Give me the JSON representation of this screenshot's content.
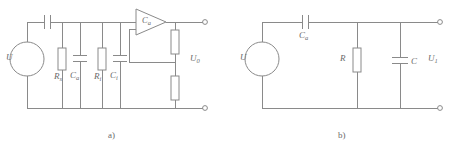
{
  "figure": {
    "background_color": "#ffffff",
    "line_color": "#8a8a8a",
    "text_color": "#6b6b6b"
  },
  "circuits": [
    {
      "id": "circuit-a",
      "caption": "a)",
      "caption_x": 108,
      "caption_y": 131,
      "source": {
        "name": "voltage-source",
        "label": "U",
        "label_sub": "",
        "label_x": 6,
        "label_y": 53,
        "cx": 27,
        "cy": 59,
        "r": 17
      },
      "labels": [
        {
          "name": "source-label",
          "text": "U",
          "sub": "",
          "x": 6,
          "y": 54
        },
        {
          "name": "series-capacitor-label",
          "text": "",
          "sub": "",
          "x": 0,
          "y": 0
        },
        {
          "name": "resistor-rs-label",
          "text": "R",
          "sub": "s",
          "x": 55,
          "y": 74
        },
        {
          "name": "capacitor-ca-label",
          "text": "C",
          "sub": "a",
          "x": 71,
          "y": 73
        },
        {
          "name": "resistor-ri-label",
          "text": "R",
          "sub": "i",
          "x": 95,
          "y": 74
        },
        {
          "name": "capacitor-ci-label",
          "text": "C",
          "sub": "i",
          "x": 111,
          "y": 73
        },
        {
          "name": "amplifier-gain-label",
          "text": "C",
          "sub": "a",
          "x": 145,
          "y": 18
        },
        {
          "name": "output-voltage-label",
          "text": "U",
          "sub": "0",
          "x": 192,
          "y": 55
        }
      ],
      "components": {
        "series_capacitor": {
          "name": "series-capacitor",
          "x": 47,
          "y": 18
        },
        "resistor_rs": {
          "name": "resistor-rs",
          "x": 62,
          "y": 50
        },
        "capacitor_ca": {
          "name": "capacitor-ca",
          "x": 80,
          "y": 55
        },
        "resistor_ri": {
          "name": "resistor-ri",
          "x": 102,
          "y": 50
        },
        "capacitor_ci": {
          "name": "capacitor-ci",
          "x": 120,
          "y": 55
        },
        "amplifier": {
          "name": "amplifier-triangle",
          "x": 136,
          "y": 8
        },
        "divider_top": {
          "name": "feedback-resistor-top",
          "x": 175,
          "y": 26
        },
        "divider_bottom": {
          "name": "feedback-resistor-bottom",
          "x": 175,
          "y": 72
        }
      },
      "terminals": [
        {
          "name": "output-terminal-top",
          "cx": 205,
          "cy": 22
        },
        {
          "name": "output-terminal-bottom",
          "cx": 205,
          "cy": 108
        }
      ]
    },
    {
      "id": "circuit-b",
      "caption": "b)",
      "caption_x": 338,
      "caption_y": 131,
      "source": {
        "name": "voltage-source",
        "label": "U",
        "label_sub": "",
        "label_x": 240,
        "label_y": 53,
        "cx": 262,
        "cy": 59,
        "r": 17
      },
      "labels": [
        {
          "name": "source-label",
          "text": "U",
          "sub": "",
          "x": 240,
          "y": 54
        },
        {
          "name": "series-capacitor-ca-label",
          "text": "C",
          "sub": "a",
          "x": 307,
          "y": 32
        },
        {
          "name": "resistor-r-label",
          "text": "R",
          "sub": "",
          "x": 340,
          "y": 55
        },
        {
          "name": "capacitor-c-label",
          "text": "C",
          "sub": "",
          "x": 410,
          "y": 58
        },
        {
          "name": "output-voltage-label",
          "text": "U",
          "sub": "1",
          "x": 428,
          "y": 55
        }
      ],
      "components": {
        "series_capacitor": {
          "name": "series-capacitor-ca",
          "x": 305,
          "y": 18
        },
        "resistor_r": {
          "name": "resistor-r",
          "x": 357,
          "y": 48
        },
        "capacitor_c": {
          "name": "capacitor-c",
          "x": 395,
          "y": 55
        }
      },
      "terminals": [
        {
          "name": "output-terminal-top",
          "cx": 440,
          "cy": 22
        },
        {
          "name": "output-terminal-bottom",
          "cx": 440,
          "cy": 108
        }
      ]
    }
  ]
}
